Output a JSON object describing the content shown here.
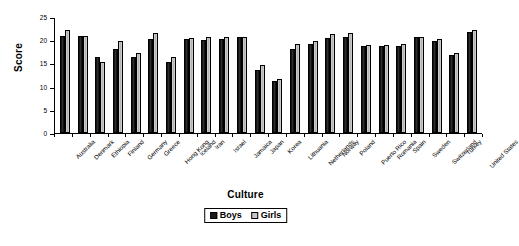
{
  "chart_data": {
    "type": "bar",
    "title": "",
    "xlabel": "Culture",
    "ylabel": "Score",
    "ylim": [
      0,
      25
    ],
    "yticks": [
      0,
      5,
      10,
      15,
      20,
      25
    ],
    "grid": false,
    "legend_position": "bottom-center",
    "categories": [
      "Australia",
      "Denmark",
      "Ethiopia",
      "Finland",
      "Germany",
      "Greece",
      "Hong Kong",
      "Iceland",
      "Iran",
      "Israel",
      "Jamaica",
      "Japan",
      "Korea",
      "Lithuania",
      "Netherlands",
      "Norway",
      "Poland",
      "Puerto Rico",
      "Romania",
      "Spain",
      "Sweden",
      "Switzerland",
      "Turkey",
      "United States"
    ],
    "series": [
      {
        "name": "Boys",
        "color": "#1c1c1c",
        "values": [
          21.0,
          20.9,
          16.4,
          18.1,
          16.3,
          20.3,
          15.3,
          20.2,
          20.1,
          20.3,
          20.6,
          13.6,
          11.3,
          18.0,
          19.2,
          20.4,
          20.7,
          18.8,
          18.7,
          18.8,
          20.6,
          19.9,
          16.8,
          21.8
        ],
        "swatch": "dark-filled-square"
      },
      {
        "name": "Girls",
        "color": "#c6c6c6",
        "values": [
          22.3,
          20.9,
          15.2,
          19.8,
          17.3,
          21.6,
          16.3,
          20.5,
          20.8,
          20.7,
          20.8,
          14.6,
          11.6,
          19.2,
          19.9,
          21.3,
          21.5,
          19.0,
          18.9,
          19.2,
          20.8,
          20.2,
          17.2,
          22.3
        ],
        "swatch": "light-filled-square"
      }
    ]
  },
  "axes": {
    "y_title": "Score",
    "x_title": "Culture"
  },
  "legend": {
    "items": [
      {
        "label": "Boys"
      },
      {
        "label": "Girls"
      }
    ]
  }
}
